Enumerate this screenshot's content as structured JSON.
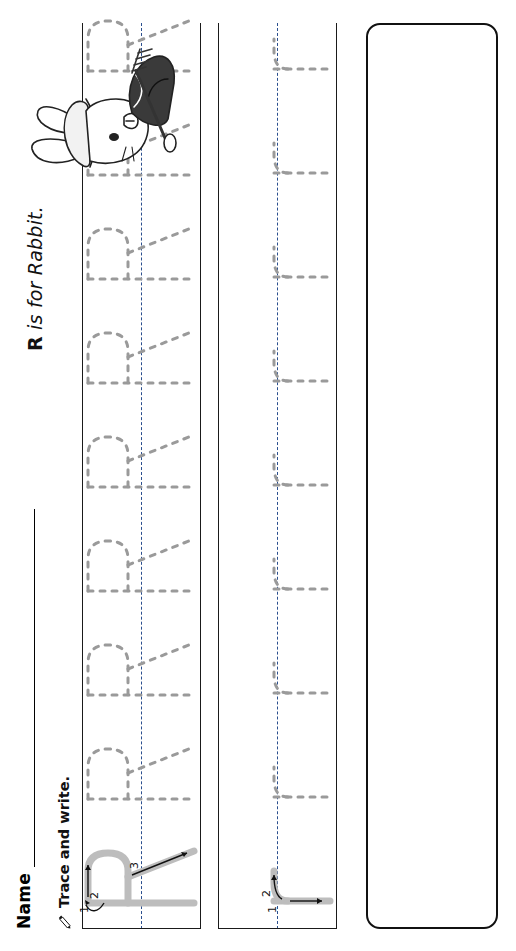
{
  "page": {
    "width": 516,
    "height": 951,
    "orientation": "rotated-90-ccw",
    "background": "#ffffff",
    "ink_color": "#111111",
    "guide_color": "#2b4f8e",
    "trace_gray": "#c9c9c9"
  },
  "name_field": {
    "label": "Name",
    "value": "",
    "placeholder": ""
  },
  "title": {
    "letter": "R",
    "text": "R is for Rabbit.",
    "prefix": "R",
    "rest": " is for Rabbit."
  },
  "instructions": [
    {
      "icon": "pencil-icon",
      "text": "Trace and write."
    },
    {
      "icon": "pencil-icon",
      "text": "Circle every R and every r."
    }
  ],
  "practice": {
    "upper": {
      "letter": "R",
      "stroke_numbers": [
        "1",
        "2",
        "3"
      ],
      "model_count": 1,
      "trace_count": 2,
      "blank_count": 7,
      "line_style": "top-solid, middle-dashed, baseline-solid"
    },
    "lower": {
      "letter": "r",
      "stroke_numbers": [
        "1",
        "2"
      ],
      "model_count": 1,
      "trace_count": 2,
      "blank_count": 7,
      "line_style": "top-solid, middle-dashed, baseline-solid"
    }
  },
  "activity_box": {
    "prompt": "Circle every R and every r.",
    "content": "",
    "border_color": "#111111"
  },
  "illustration": {
    "name": "rabbit-illustration",
    "description": "Rabbit wearing a hat and coat holding a rake",
    "alt": "R is for Rabbit"
  }
}
